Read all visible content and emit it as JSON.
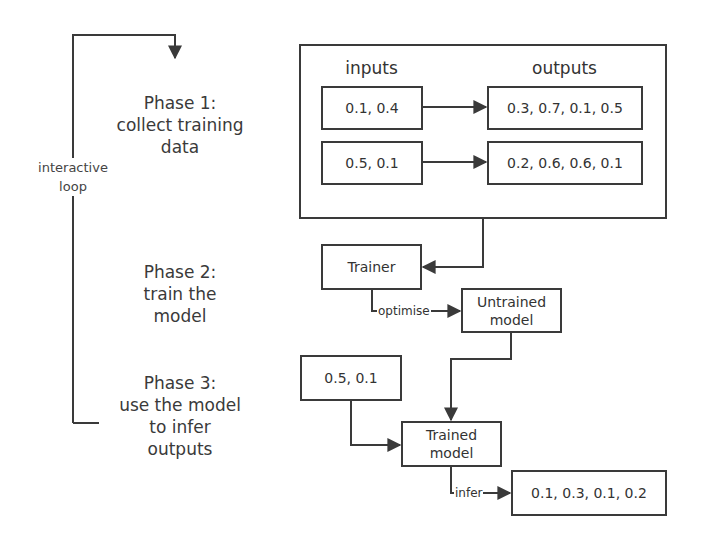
{
  "loop": {
    "label_line1": "interactive",
    "label_line2": "loop"
  },
  "phases": [
    {
      "title": "Phase 1:",
      "line2": "collect training",
      "line3": "data"
    },
    {
      "title": "Phase 2:",
      "line2": "train the",
      "line3": "model"
    },
    {
      "title": "Phase 3:",
      "line2": "use the model",
      "line3": "to infer",
      "line4": "outputs"
    }
  ],
  "training_data": {
    "inputs_header": "inputs",
    "outputs_header": "outputs",
    "rows": [
      {
        "input": "0.1, 0.4",
        "output": "0.3, 0.7, 0.1, 0.5"
      },
      {
        "input": "0.5, 0.1",
        "output": "0.2, 0.6, 0.6, 0.1"
      }
    ]
  },
  "training": {
    "trainer": "Trainer",
    "edge_label": "optimise",
    "untrained_line1": "Untrained",
    "untrained_line2": "model"
  },
  "inference": {
    "input": "0.5, 0.1",
    "trained_line1": "Trained",
    "trained_line2": "model",
    "edge_label": "infer",
    "output": "0.1, 0.3, 0.1, 0.2"
  },
  "colors": {
    "stroke": "#3a3a3a",
    "text": "#333333",
    "background": "#ffffff"
  }
}
